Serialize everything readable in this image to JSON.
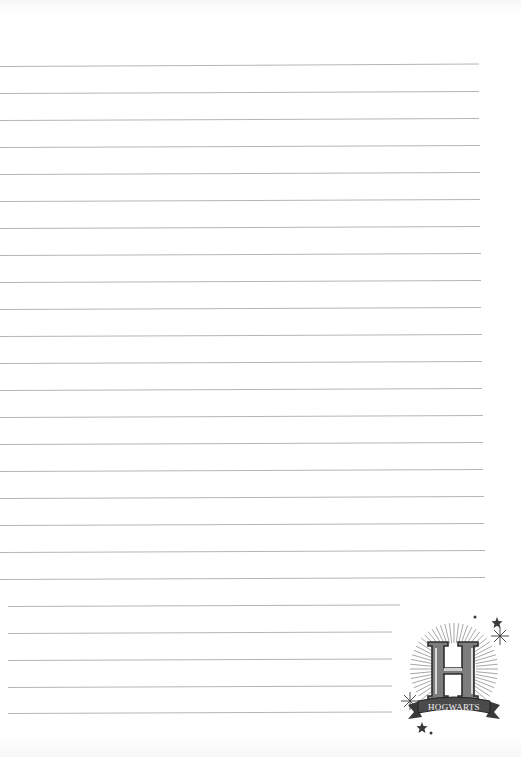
{
  "page": {
    "type": "lined-notebook-page",
    "background_color": "#ffffff",
    "line_color": "#b5b5b5",
    "line_count": 24
  },
  "lines": [
    {
      "y": 66,
      "x1": 0,
      "x2": 479,
      "tilt": -1.2
    },
    {
      "y": 93,
      "x1": 0,
      "x2": 479,
      "tilt": -1.0
    },
    {
      "y": 120,
      "x1": 0,
      "x2": 479,
      "tilt": -1.0
    },
    {
      "y": 147,
      "x1": 0,
      "x2": 480,
      "tilt": -1.0
    },
    {
      "y": 174,
      "x1": 0,
      "x2": 480,
      "tilt": -1.0
    },
    {
      "y": 201,
      "x1": 0,
      "x2": 480,
      "tilt": -1.0
    },
    {
      "y": 228,
      "x1": 0,
      "x2": 480,
      "tilt": -1.0
    },
    {
      "y": 255,
      "x1": 0,
      "x2": 481,
      "tilt": -1.0
    },
    {
      "y": 282,
      "x1": 0,
      "x2": 481,
      "tilt": -1.0
    },
    {
      "y": 309,
      "x1": 0,
      "x2": 481,
      "tilt": -1.0
    },
    {
      "y": 336,
      "x1": 0,
      "x2": 482,
      "tilt": -1.0
    },
    {
      "y": 363,
      "x1": 0,
      "x2": 482,
      "tilt": -1.0
    },
    {
      "y": 390,
      "x1": 0,
      "x2": 482,
      "tilt": -1.0
    },
    {
      "y": 417,
      "x1": 0,
      "x2": 483,
      "tilt": -1.0
    },
    {
      "y": 444,
      "x1": 0,
      "x2": 483,
      "tilt": -1.0
    },
    {
      "y": 471,
      "x1": 0,
      "x2": 483,
      "tilt": -1.0
    },
    {
      "y": 498,
      "x1": 0,
      "x2": 484,
      "tilt": -1.0
    },
    {
      "y": 525,
      "x1": 0,
      "x2": 484,
      "tilt": -1.0
    },
    {
      "y": 552,
      "x1": 0,
      "x2": 485,
      "tilt": -1.0
    },
    {
      "y": 579,
      "x1": 0,
      "x2": 485,
      "tilt": -1.0
    },
    {
      "y": 606,
      "x1": 8,
      "x2": 400,
      "tilt": -0.9
    },
    {
      "y": 633,
      "x1": 8,
      "x2": 392,
      "tilt": -0.9
    },
    {
      "y": 660,
      "x1": 8,
      "x2": 392,
      "tilt": -0.9
    },
    {
      "y": 687,
      "x1": 8,
      "x2": 392,
      "tilt": -0.9
    },
    {
      "y": 713,
      "x1": 8,
      "x2": 392,
      "tilt": -0.9
    }
  ],
  "crest": {
    "letter": "H",
    "banner_text": "HOGWARTS",
    "icon": "hogwarts-crest-icon"
  }
}
